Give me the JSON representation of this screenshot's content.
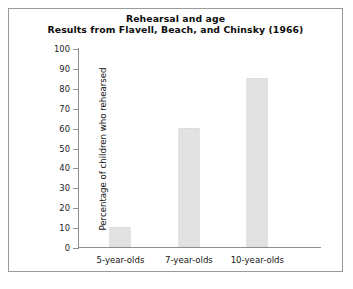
{
  "chart_data": {
    "type": "bar",
    "title": "Rehearsal and age",
    "subtitle": "Results from Flavell, Beach, and Chinsky (1966)",
    "categories": [
      "5-year-olds",
      "7-year-olds",
      "10-year-olds"
    ],
    "values": [
      10,
      60,
      85
    ],
    "xlabel": "",
    "ylabel": "Percentage of children who rehearsed",
    "ylim": [
      0,
      100
    ],
    "ytick_labels": [
      "0",
      "10",
      "20",
      "30",
      "40",
      "50",
      "60",
      "70",
      "80",
      "90",
      "100"
    ],
    "ytick_values": [
      0,
      10,
      20,
      30,
      40,
      50,
      60,
      70,
      80,
      90,
      100
    ],
    "grid": false,
    "legend": "none",
    "bar_color": "#e2e2e2",
    "axis_color": "#8f8f8f",
    "frame_color": "#9a9a9a",
    "background": "#ffffff"
  }
}
